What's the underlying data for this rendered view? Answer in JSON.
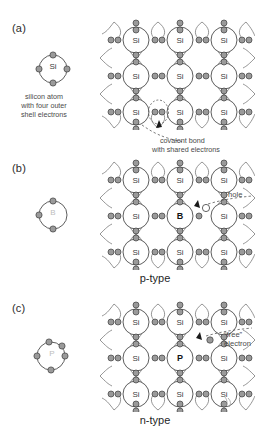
{
  "figure": {
    "background_color": "#ffffff",
    "ink_color": "#3c3c3c"
  },
  "panels": [
    {
      "id": "a",
      "label": "(a)",
      "atom_symbol": "Si",
      "atom_valence_electrons": 4,
      "caption_lines": [
        "silicon atom",
        "with four outer",
        "shell electrons"
      ],
      "annotation_lines": [
        "covalent bond",
        "with shared electrons"
      ],
      "lattice_center_symbol": "Si",
      "lattice_symbols": [
        "Si",
        "Si",
        "Si",
        "Si",
        "Si",
        "Si",
        "Si",
        "Si",
        "Si"
      ],
      "type_label": ""
    },
    {
      "id": "b",
      "label": "(b)",
      "atom_symbol": "B",
      "atom_valence_electrons": 3,
      "caption_lines": [],
      "annotation_lines": [
        "hole"
      ],
      "lattice_center_symbol": "B",
      "lattice_symbols": [
        "Si",
        "Si",
        "Si",
        "Si",
        "B",
        "Si",
        "Si",
        "Si",
        "Si"
      ],
      "type_label": "p-type"
    },
    {
      "id": "c",
      "label": "(c)",
      "atom_symbol": "P",
      "atom_valence_electrons": 5,
      "caption_lines": [],
      "annotation_lines": [
        "“free”",
        "electron"
      ],
      "lattice_center_symbol": "P",
      "lattice_symbols": [
        "Si",
        "Si",
        "Si",
        "Si",
        "P",
        "Si",
        "Si",
        "Si",
        "Si"
      ],
      "type_label": "n-type"
    }
  ],
  "labels": {
    "panel_a": "(a)",
    "panel_b": "(b)",
    "panel_c": "(c)",
    "si_symbol": "Si",
    "b_symbol": "B",
    "p_symbol": "P",
    "caption_a_l1": "silicon atom",
    "caption_a_l2": "with four outer",
    "caption_a_l3": "shell electrons",
    "annot_a_l1": "covalent bond",
    "annot_a_l2": "with shared electrons",
    "annot_b_l1": "hole",
    "annot_c_l1": "“free”",
    "annot_c_l2": "electron",
    "ptype": "p-type",
    "ntype": "n-type"
  },
  "lattice_a": {
    "row1": [
      "Si",
      "Si",
      "Si"
    ],
    "row2": [
      "Si",
      "Si",
      "Si"
    ],
    "row3": [
      "Si",
      "Si",
      "Si"
    ]
  },
  "lattice_b": {
    "row1": [
      "Si",
      "Si",
      "Si"
    ],
    "row2": [
      "Si",
      "B",
      "Si"
    ],
    "row3": [
      "Si",
      "Si",
      "Si"
    ]
  },
  "lattice_c": {
    "row1": [
      "Si",
      "Si",
      "Si"
    ],
    "row2": [
      "Si",
      "P",
      "Si"
    ],
    "row3": [
      "Si",
      "Si",
      "Si"
    ]
  }
}
